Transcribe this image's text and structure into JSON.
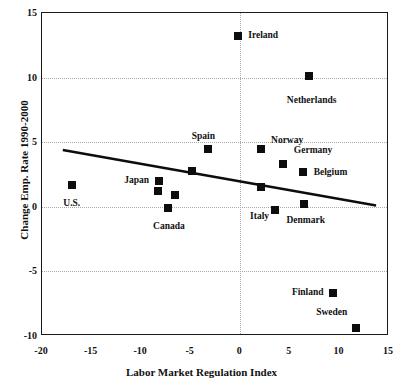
{
  "chart_data": {
    "type": "scatter",
    "title": "",
    "xlabel": "Labor Market Regulation Index",
    "ylabel": "Change Emp. Rate 1990-2000",
    "xlim": [
      -20,
      15
    ],
    "ylim": [
      -10,
      15
    ],
    "xticks": [
      -20,
      -15,
      -10,
      -5,
      0,
      5,
      10,
      15
    ],
    "xtick_labels": [
      "-20",
      "-15",
      "-10",
      "-5",
      "0",
      "5",
      "10",
      "15"
    ],
    "yticks": [
      -10,
      -5,
      0,
      5,
      10,
      15
    ],
    "ytick_labels": [
      "-10",
      "-5",
      "0",
      "5",
      "10",
      "15"
    ],
    "grid": "dotted gridlines at y = 10, 5, 0, -5 and x = 0",
    "legend": "none",
    "marker_style": "filled black square",
    "points": [
      {
        "name": "Ireland",
        "x": -0.2,
        "y": 13.2,
        "label_pos": "right"
      },
      {
        "name": "Netherlands",
        "x": 6.9,
        "y": 10.1,
        "label_pos": "below"
      },
      {
        "name": "Spain",
        "x": -3.3,
        "y": 4.5,
        "label_pos": "above-left"
      },
      {
        "name": "Norway",
        "x": 2.1,
        "y": 4.5,
        "label_pos": "right"
      },
      {
        "name": "Germany",
        "x": 4.3,
        "y": 3.3,
        "label_pos": "right"
      },
      {
        "name": "Belgium",
        "x": 6.3,
        "y": 2.7,
        "label_pos": "right"
      },
      {
        "name": "Spain2",
        "x": -4.9,
        "y": 2.8,
        "label_pos": "none"
      },
      {
        "name": "Japan",
        "x": -8.2,
        "y": 2.0,
        "label_pos": "left"
      },
      {
        "name": "U.S.",
        "x": -17.0,
        "y": 1.7,
        "label_pos": "below"
      },
      {
        "name": "Italy2",
        "x": 2.1,
        "y": 1.5,
        "label_pos": "none"
      },
      {
        "name": "Japan2",
        "x": -8.3,
        "y": 1.2,
        "label_pos": "none"
      },
      {
        "name": "Unlabeled1",
        "x": -6.6,
        "y": 0.9,
        "label_pos": "none"
      },
      {
        "name": "Denmark",
        "x": 6.4,
        "y": 0.2,
        "label_pos": "below"
      },
      {
        "name": "Canada",
        "x": -7.3,
        "y": -0.1,
        "label_pos": "below"
      },
      {
        "name": "Italy",
        "x": 3.5,
        "y": -0.25,
        "label_pos": "left"
      },
      {
        "name": "Finland",
        "x": 9.4,
        "y": -6.7,
        "label_pos": "left"
      },
      {
        "name": "Sweden",
        "x": 11.7,
        "y": -9.4,
        "label_pos": "above-left"
      }
    ],
    "labels": [
      {
        "text": "Ireland",
        "x": 0.8,
        "y": 13.2,
        "anchor": "right"
      },
      {
        "text": "Netherlands",
        "x": 7.2,
        "y": 8.6,
        "anchor": "below"
      },
      {
        "text": "Spain",
        "x": -4.9,
        "y": 5.4,
        "anchor": "right"
      },
      {
        "text": "Norway",
        "x": 3.1,
        "y": 5.1,
        "anchor": "right"
      },
      {
        "text": "Germany",
        "x": 5.4,
        "y": 4.3,
        "anchor": "right"
      },
      {
        "text": "Belgium",
        "x": 7.4,
        "y": 2.6,
        "anchor": "right"
      },
      {
        "text": "Japan",
        "x": -9.2,
        "y": 2.0,
        "anchor": "left"
      },
      {
        "text": "U.S.",
        "x": -17.0,
        "y": 0.6,
        "anchor": "below"
      },
      {
        "text": "Denmark",
        "x": 6.6,
        "y": -0.7,
        "anchor": "below"
      },
      {
        "text": "Canada",
        "x": -7.2,
        "y": -1.2,
        "anchor": "below"
      },
      {
        "text": "Italy",
        "x": 2.9,
        "y": -0.8,
        "anchor": "left"
      },
      {
        "text": "Finland",
        "x": 8.4,
        "y": -6.7,
        "anchor": "left"
      },
      {
        "text": "Sweden",
        "x": 10.8,
        "y": -8.2,
        "anchor": "left"
      }
    ],
    "trendline": {
      "description": "negative-slope linear fit",
      "x0": -17.9,
      "y0": 4.4,
      "x1": 13.7,
      "y1": 0.1
    }
  }
}
